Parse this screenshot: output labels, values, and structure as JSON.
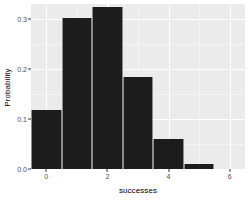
{
  "chart_data": {
    "type": "bar",
    "title": "",
    "subtitle": "",
    "xlabel": "successes",
    "ylabel": "Probability",
    "categories": [
      "0",
      "1",
      "2",
      "3",
      "4",
      "5"
    ],
    "x": [
      0,
      1,
      2,
      3,
      4,
      5
    ],
    "values": [
      0.118,
      0.303,
      0.324,
      0.185,
      0.06,
      0.01
    ],
    "series": [
      {
        "name": "Probability",
        "values": [
          0.118,
          0.303,
          0.324,
          0.185,
          0.06,
          0.01
        ]
      }
    ],
    "xlim": [
      -0.5,
      6.5
    ],
    "ylim": [
      0.0,
      0.33
    ],
    "x_ticks": [
      0,
      2,
      4,
      6
    ],
    "x_tick_labels": [
      "0",
      "2",
      "4",
      "6"
    ],
    "x_minor_ticks": [
      1,
      3,
      5
    ],
    "y_ticks": [
      0.0,
      0.1,
      0.2,
      0.3
    ],
    "y_tick_labels": [
      "0.0",
      "0.1",
      "0.2",
      "0.3"
    ],
    "y_minor_ticks": [
      0.05,
      0.15,
      0.25
    ],
    "grid": true,
    "legend": false,
    "legend_position": "none",
    "bar_color": "#1c1c1c",
    "bar_border_color": "#8c8c8c",
    "panel_background": "#ebebeb",
    "grid_color": "#ffffff",
    "grid_minor_color": "#f5f5f5",
    "axis_text_color": "#4d4d4d",
    "axis_title_color": "#000000",
    "bar_width": 1.0,
    "annotations": []
  }
}
